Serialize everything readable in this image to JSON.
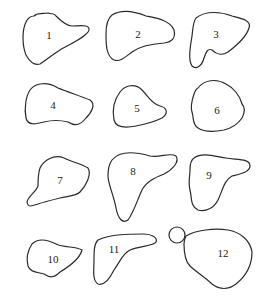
{
  "diagram": {
    "type": "numbered-outline-shapes",
    "shape_count": 12,
    "stroke_color": "#2a2a2a",
    "background": "#ffffff",
    "shapes": [
      {
        "id": 1,
        "label": "1",
        "lx": 49,
        "ly": 35
      },
      {
        "id": 2,
        "label": "2",
        "lx": 138,
        "ly": 34
      },
      {
        "id": 3,
        "label": "3",
        "lx": 216,
        "ly": 34
      },
      {
        "id": 4,
        "label": "4",
        "lx": 53,
        "ly": 105
      },
      {
        "id": 5,
        "label": "5",
        "lx": 137,
        "ly": 108
      },
      {
        "id": 6,
        "label": "6",
        "lx": 217,
        "ly": 110
      },
      {
        "id": 7,
        "label": "7",
        "lx": 60,
        "ly": 180
      },
      {
        "id": 8,
        "label": "8",
        "lx": 133,
        "ly": 171
      },
      {
        "id": 9,
        "label": "9",
        "lx": 209,
        "ly": 175
      },
      {
        "id": 10,
        "label": "10",
        "lx": 53,
        "ly": 259
      },
      {
        "id": 11,
        "label": "11",
        "lx": 114,
        "ly": 249
      },
      {
        "id": 12,
        "label": "12",
        "lx": 223,
        "ly": 253
      }
    ]
  }
}
